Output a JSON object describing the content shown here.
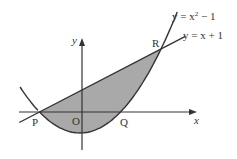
{
  "diagram": {
    "curves": [
      {
        "name": "parabola",
        "label": "y = x² − 1",
        "label_pre": "y = x",
        "label_sup": "2",
        "label_post": " − 1"
      },
      {
        "name": "line",
        "label": "y = x + 1"
      }
    ],
    "axes": {
      "x_label": "x",
      "y_label": "y",
      "origin_label": "O"
    },
    "points": [
      {
        "label": "P",
        "x": -1,
        "y": 0
      },
      {
        "label": "Q",
        "x": 1,
        "y": 0
      },
      {
        "label": "R",
        "x": 2,
        "y": 3
      }
    ],
    "shaded_region": "between y = x + 1 and y = x² − 1 from P to R",
    "colors": {
      "shade": "#a9a9a9",
      "stroke": "#333333"
    }
  }
}
